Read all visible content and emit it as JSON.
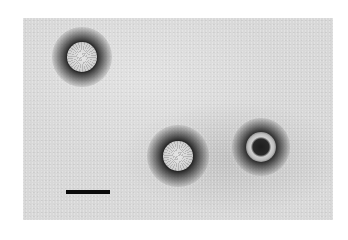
{
  "image": {
    "type": "negative-stain electron micrograph",
    "background_color": "#d8d8d8",
    "frame": {
      "x": 23,
      "y": 18,
      "width": 310,
      "height": 202
    }
  },
  "particles": [
    {
      "label": "particle-top-left",
      "cx": 82,
      "cy": 57,
      "halo_d": 60,
      "core_d": 30,
      "style": "solid"
    },
    {
      "label": "particle-bottom-center",
      "cx": 178,
      "cy": 156,
      "halo_d": 62,
      "core_d": 30,
      "style": "solid"
    },
    {
      "label": "particle-bottom-right",
      "cx": 261,
      "cy": 147,
      "halo_d": 58,
      "core_d": 30,
      "style": "ring"
    }
  ],
  "scale_bar": {
    "x": 66,
    "y": 190,
    "width": 44,
    "height": 4,
    "color": "#0a0a0a",
    "label": ""
  }
}
